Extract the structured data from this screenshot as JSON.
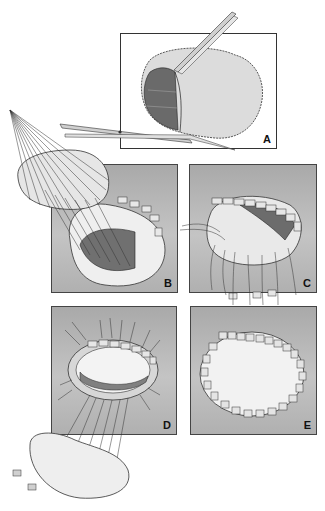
{
  "figure": {
    "panels": [
      {
        "id": "A",
        "label": "A"
      },
      {
        "id": "B",
        "label": "B"
      },
      {
        "id": "C",
        "label": "C"
      },
      {
        "id": "D",
        "label": "D"
      },
      {
        "id": "E",
        "label": "E"
      }
    ]
  },
  "colors": {
    "panel_bg": "#b8b8b8",
    "tissue_light": "#e8e8e8",
    "tissue_dark": "#6f6f6f",
    "line": "#222222"
  }
}
